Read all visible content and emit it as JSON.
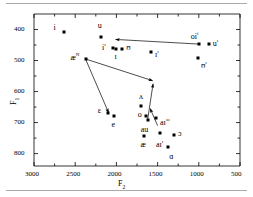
{
  "chart_data": {
    "type": "scatter",
    "title": "",
    "xlabel": "F2",
    "ylabel": "F1",
    "xticks": [
      "3000",
      "2500",
      "2000",
      "1500",
      "1000",
      "500"
    ],
    "xtickvals": [
      3000,
      2500,
      2000,
      1500,
      1000,
      500
    ],
    "yticks": [
      "400",
      "500",
      "600",
      "700",
      "800"
    ],
    "ytickvals": [
      400,
      500,
      600,
      700,
      800
    ],
    "xlim": [
      3000,
      500
    ],
    "ylim": [
      840,
      350
    ],
    "x_axis_reversed": true,
    "y_axis_reversed": true,
    "grid": false,
    "legend": "none",
    "marker": "filled-square",
    "marker_color": "#000000",
    "points": [
      {
        "label": "i",
        "sup": "",
        "x": 2630,
        "y": 408,
        "lx": -11,
        "ly": -4
      },
      {
        "label": "u",
        "sup": "",
        "x": 2190,
        "y": 425,
        "lx": -3,
        "ly": -11
      },
      {
        "label": "i",
        "sup": "ɪ",
        "x": 2040,
        "y": 459,
        "lx": -11,
        "ly": -2
      },
      {
        "label": "ɪ",
        "sup": "",
        "x": 2010,
        "y": 464,
        "lx": -1,
        "ly": 8
      },
      {
        "label": "ʊ",
        "sup": "",
        "x": 1930,
        "y": 462,
        "lx": 4,
        "ly": -1
      },
      {
        "label": "ɪ",
        "sup": "ɪ",
        "x": 1580,
        "y": 472,
        "lx": 4,
        "ly": 1
      },
      {
        "label": "oi",
        "sup": "i",
        "x": 1000,
        "y": 447,
        "lx": -8,
        "ly": -9
      },
      {
        "label": "u",
        "sup": "ɪ",
        "x": 880,
        "y": 448,
        "lx": 4,
        "ly": -2
      },
      {
        "label": "ʊ",
        "sup": "ɪ",
        "x": 1010,
        "y": 491,
        "lx": 3,
        "ly": 6
      },
      {
        "label": "æ",
        "sup": "N",
        "x": 2375,
        "y": 495,
        "lx": -15,
        "ly": -3
      },
      {
        "label": "ʌ",
        "sup": "",
        "x": 1700,
        "y": 646,
        "lx": -2,
        "ly": -9
      },
      {
        "label": "ɛ",
        "sup": "",
        "x": 2105,
        "y": 669,
        "lx": -10,
        "ly": -2
      },
      {
        "label": "e",
        "sup": "",
        "x": 2035,
        "y": 679,
        "lx": -2,
        "ly": 9
      },
      {
        "label": "o",
        "sup": "",
        "x": 1645,
        "y": 679,
        "lx": -8,
        "ly": -1
      },
      {
        "label": "au",
        "sup": "",
        "x": 1620,
        "y": 691,
        "lx": -7,
        "ly": 10
      },
      {
        "label": "aɪ",
        "sup": "ʌɪ",
        "x": 1520,
        "y": 686,
        "lx": 4,
        "ly": 3
      },
      {
        "label": "æ",
        "sup": "",
        "x": 1670,
        "y": 742,
        "lx": -3,
        "ly": 9
      },
      {
        "label": "aɪ",
        "sup": "ɪ",
        "x": 1470,
        "y": 733,
        "lx": -4,
        "ly": 10
      },
      {
        "label": "ɔ",
        "sup": "",
        "x": 1300,
        "y": 740,
        "lx": 4,
        "ly": -1
      },
      {
        "label": "ɑ",
        "sup": "",
        "x": 1370,
        "y": 780,
        "lx": 1,
        "ly": 10
      }
    ],
    "arrows": [
      {
        "name": "arrow-oi-to-front",
        "x1": 1000,
        "y1": 447,
        "x2": 2010,
        "y2": 432
      },
      {
        "name": "arrow-ae-to-mid",
        "x1": 2375,
        "y1": 495,
        "x2": 1560,
        "y2": 565
      },
      {
        "name": "arrow-ae-to-epsilon",
        "x1": 2375,
        "y1": 495,
        "x2": 2095,
        "y2": 668
      },
      {
        "name": "arrow-mid-to-up",
        "x1": 1620,
        "y1": 689,
        "x2": 1555,
        "y2": 575
      },
      {
        "name": "arrow-ai-to-upright",
        "x1": 1500,
        "y1": 710,
        "x2": 1590,
        "y2": 655
      }
    ]
  },
  "axes": {
    "x_title": "F",
    "x_sub": "2",
    "y_title": "F",
    "y_sub": "1"
  }
}
